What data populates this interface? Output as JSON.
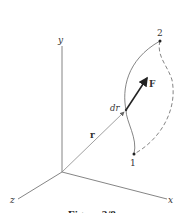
{
  "figure": {
    "caption": "Figure 2/8",
    "axes": {
      "x_label": "x",
      "y_label": "y",
      "z_label": "z"
    },
    "vectors": {
      "position_label": "r",
      "displacement_label": "dr",
      "force_label": "F"
    },
    "points": {
      "start_label": "1",
      "end_label": "2"
    },
    "colors": {
      "line": "#555555",
      "axis": "#777777",
      "force": "#222222",
      "background": "#ffffff"
    }
  }
}
